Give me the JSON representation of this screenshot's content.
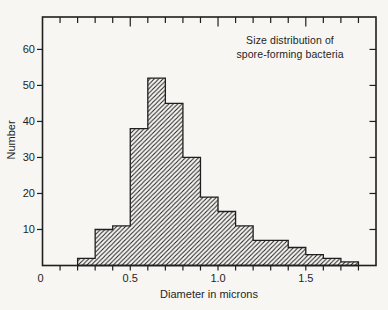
{
  "figure": {
    "title_line1": "Size distribution of",
    "title_line2": "spore-forming bacteria",
    "xlabel": "Diameter in microns",
    "ylabel": "Number"
  },
  "colors": {
    "ink": "#1f1f1f",
    "background": "#f7f6f3"
  },
  "chart_data": {
    "type": "bar",
    "subtype": "histogram",
    "title": "Size distribution of spore-forming bacteria",
    "xlabel": "Diameter in microns",
    "ylabel": "Number",
    "bin_start": 0.2,
    "bin_width": 0.1,
    "counts": [
      2,
      10,
      11,
      38,
      52,
      45,
      30,
      19,
      15,
      11,
      7,
      7,
      5,
      3,
      2,
      1
    ],
    "bin_edges": [
      0.2,
      0.3,
      0.4,
      0.5,
      0.6,
      0.7,
      0.8,
      0.9,
      1.0,
      1.1,
      1.2,
      1.3,
      1.4,
      1.5,
      1.6,
      1.7,
      1.8
    ],
    "xlim": [
      0,
      1.9
    ],
    "ylim": [
      0,
      69
    ],
    "x_major_ticks": [
      [
        0,
        "0"
      ],
      [
        0.5,
        "0.5"
      ],
      [
        1.0,
        "1.0"
      ],
      [
        1.5,
        "1.5"
      ]
    ],
    "x_minor_step": 0.1,
    "x_minor_min": 0.1,
    "x_minor_max": 1.8,
    "y_ticks": [
      10,
      20,
      30,
      40,
      50,
      60
    ],
    "grid": false,
    "legend": "none",
    "fill_style": "diagonal-hatch"
  }
}
